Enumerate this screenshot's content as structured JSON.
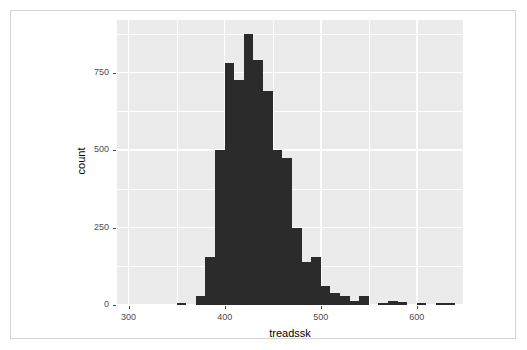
{
  "figure": {
    "background_color": "#ffffff",
    "border_color": "#d5d5d5",
    "panel_color": "#ebebeb",
    "grid_color": "#ffffff",
    "bar_color": "#2b2b2b",
    "axis_text_color": "#4d4d4d"
  },
  "axes": {
    "x_label": "treadssk",
    "y_label": "count",
    "x_ticks": [
      "300",
      "400",
      "500",
      "600"
    ],
    "x_tick_values": [
      300,
      400,
      500,
      600
    ],
    "y_ticks": [
      "0",
      "250",
      "500",
      "750"
    ],
    "y_tick_values": [
      0,
      250,
      500,
      750
    ]
  },
  "chart_data": {
    "type": "bar",
    "title": "",
    "subtitle": "",
    "xlabel": "treadssk",
    "ylabel": "count",
    "xlim": [
      288,
      648
    ],
    "ylim": [
      0,
      920
    ],
    "grid": true,
    "legend": "none",
    "bin_width": 10,
    "note": "Histogram of treadssk; bins are 10 units wide starting at 290.",
    "categories": [
      "290-300",
      "300-310",
      "310-320",
      "320-330",
      "330-340",
      "340-350",
      "350-360",
      "360-370",
      "370-380",
      "380-390",
      "390-400",
      "400-410",
      "410-420",
      "420-430",
      "430-440",
      "440-450",
      "450-460",
      "460-470",
      "470-480",
      "480-490",
      "490-500",
      "500-510",
      "510-520",
      "520-530",
      "530-540",
      "540-550",
      "550-560",
      "560-570",
      "570-580",
      "580-590",
      "590-600",
      "600-610",
      "610-620",
      "620-630",
      "630-640"
    ],
    "bin_starts": [
      290,
      300,
      310,
      320,
      330,
      340,
      350,
      360,
      370,
      380,
      390,
      400,
      410,
      420,
      430,
      440,
      450,
      460,
      470,
      480,
      490,
      500,
      510,
      520,
      530,
      540,
      550,
      560,
      570,
      580,
      590,
      600,
      610,
      620,
      630
    ],
    "values": [
      0,
      0,
      0,
      0,
      0,
      0,
      5,
      0,
      30,
      155,
      500,
      780,
      725,
      875,
      790,
      690,
      500,
      475,
      250,
      140,
      155,
      60,
      40,
      30,
      12,
      30,
      0,
      8,
      12,
      10,
      0,
      8,
      0,
      5,
      5
    ]
  }
}
